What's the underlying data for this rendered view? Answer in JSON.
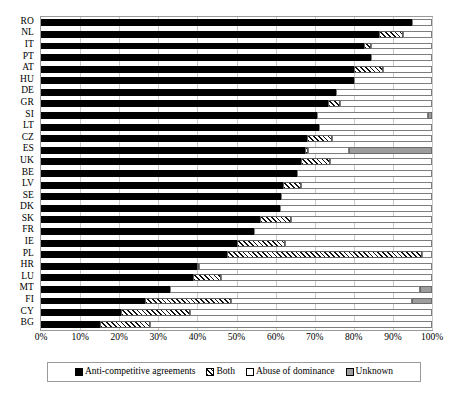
{
  "chart_data": {
    "type": "bar",
    "orientation": "horizontal",
    "stacked": true,
    "normalized": true,
    "title": "",
    "subtitle": "",
    "xlabel": "",
    "ylabel": "",
    "xlim": [
      0,
      100
    ],
    "xticks": [
      0,
      10,
      20,
      30,
      40,
      50,
      60,
      70,
      80,
      90,
      100
    ],
    "xticklabels": [
      "0%",
      "10%",
      "20%",
      "30%",
      "40%",
      "50%",
      "60%",
      "70%",
      "80%",
      "90%",
      "100%"
    ],
    "grid": "vertical",
    "legend_position": "bottom",
    "categories": [
      "RO",
      "NL",
      "IT",
      "PT",
      "AT",
      "HU",
      "DE",
      "GR",
      "SI",
      "LT",
      "CZ",
      "ES",
      "UK",
      "BE",
      "LV",
      "SE",
      "DK",
      "SK",
      "FR",
      "IE",
      "PL",
      "HR",
      "LU",
      "MT",
      "FI",
      "CY",
      "BG"
    ],
    "series": [
      {
        "name": "Anti-competitive agreements",
        "pattern": "solid-black",
        "color": "#000000",
        "values": [
          95.0,
          86.5,
          82.5,
          84.5,
          80.0,
          80.0,
          75.5,
          73.5,
          70.5,
          71.0,
          68.0,
          67.5,
          66.5,
          65.5,
          62.0,
          61.5,
          61.0,
          56.0,
          54.5,
          50.0,
          47.5,
          40.0,
          39.0,
          33.0,
          26.5,
          20.5,
          15.0
        ]
      },
      {
        "name": "Both",
        "pattern": "diagonal-hatch",
        "color": "#ffffff",
        "values": [
          0.0,
          6.0,
          2.0,
          0.0,
          7.5,
          0.0,
          0.0,
          3.0,
          0.0,
          0.0,
          6.5,
          0.7,
          7.5,
          0.0,
          4.5,
          0.0,
          0.0,
          8.0,
          0.0,
          12.5,
          50.0,
          0.5,
          7.0,
          0.0,
          22.0,
          17.5,
          13.0
        ]
      },
      {
        "name": "Abuse of dominance",
        "pattern": "white",
        "color": "#ffffff",
        "values": [
          5.0,
          7.5,
          15.5,
          15.5,
          12.5,
          20.0,
          24.5,
          23.5,
          28.5,
          29.0,
          25.5,
          10.5,
          26.0,
          34.5,
          33.5,
          38.5,
          39.0,
          36.0,
          45.5,
          37.5,
          2.5,
          59.5,
          54.0,
          64.0,
          46.5,
          62.0,
          72.0
        ]
      },
      {
        "name": "Unknown",
        "pattern": "gray",
        "color": "#9d9d9d",
        "values": [
          0.0,
          0.0,
          0.0,
          0.0,
          0.0,
          0.0,
          0.0,
          0.0,
          1.0,
          0.0,
          0.0,
          21.3,
          0.0,
          0.0,
          0.0,
          0.0,
          0.0,
          0.0,
          0.0,
          0.0,
          0.0,
          0.0,
          0.0,
          3.0,
          5.0,
          0.0,
          0.0
        ]
      }
    ]
  },
  "legend": {
    "items": [
      {
        "label": "Anti-competitive agreements",
        "swatch": "anti"
      },
      {
        "label": "Both",
        "swatch": "both"
      },
      {
        "label": "Abuse of dominance",
        "swatch": "abuse"
      },
      {
        "label": "Unknown",
        "swatch": "unknown"
      }
    ]
  }
}
